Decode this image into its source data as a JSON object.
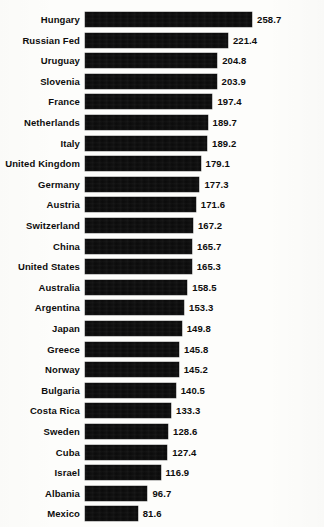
{
  "chart_data": {
    "type": "bar",
    "orientation": "horizontal",
    "title": "",
    "subtitle": "",
    "xlabel": "",
    "ylabel": "",
    "grid": false,
    "legend": null,
    "axis_visible": false,
    "tick_labels": [],
    "value_labels_shown": true,
    "value_label_decimals": 1,
    "xlim": [
      0,
      258.7
    ],
    "bar_color": "#0a0a0a",
    "background_color": "#fdfdfb",
    "text_color": "#0d0d0d",
    "categories": [
      "Hungary",
      "Russian Fed",
      "Uruguay",
      "Slovenia",
      "France",
      "Netherlands",
      "Italy",
      "United Kingdom",
      "Germany",
      "Austria",
      "Switzerland",
      "China",
      "United States",
      "Australia",
      "Argentina",
      "Japan",
      "Greece",
      "Norway",
      "Bulgaria",
      "Costa Rica",
      "Sweden",
      "Cuba",
      "Israel",
      "Albania",
      "Mexico"
    ],
    "values": [
      258.7,
      221.4,
      204.8,
      203.9,
      197.4,
      189.7,
      189.2,
      179.1,
      177.3,
      171.6,
      167.2,
      165.7,
      165.3,
      158.5,
      153.3,
      149.8,
      145.8,
      145.2,
      140.5,
      133.3,
      128.6,
      127.4,
      116.9,
      96.7,
      81.6
    ],
    "value_text": [
      "258.7",
      "221.4",
      "204.8",
      "203.9",
      "197.4",
      "189.7",
      "189.2",
      "179.1",
      "177.3",
      "171.6",
      "167.2",
      "165.7",
      "165.3",
      "158.5",
      "153.3",
      "149.8",
      "145.8",
      "145.2",
      "140.5",
      "133.3",
      "128.6",
      "127.4",
      "116.9",
      "96.7",
      "81.6"
    ]
  },
  "layout": {
    "bar_origin_x": 85,
    "px_per_unit": 0.6455,
    "first_row_top": 12,
    "row_pitch": 20.6,
    "bar_height": 15,
    "value_label_gap": 5
  }
}
